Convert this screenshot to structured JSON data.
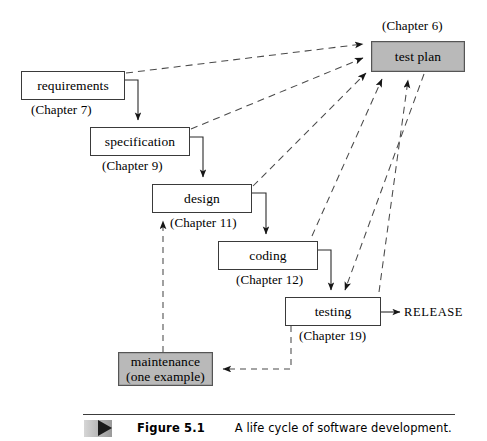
{
  "figure": {
    "number": "Figure 5.1",
    "caption": "A life cycle of software development.",
    "marker_icon": "triangle-right-icon"
  },
  "diagram": {
    "type": "flow-diagram",
    "title": "A life cycle of software development",
    "shaded_fill": "#b9b9b9",
    "nodes": [
      {
        "id": "requirements",
        "label": "requirements",
        "chapter": "(Chapter 7)",
        "shaded": false,
        "x": 21,
        "y": 71,
        "w": 104,
        "h": 29
      },
      {
        "id": "specification",
        "label": "specification",
        "chapter": "(Chapter 9)",
        "shaded": false,
        "x": 90,
        "y": 127,
        "w": 100,
        "h": 29
      },
      {
        "id": "design",
        "label": "design",
        "chapter": "(Chapter 11)",
        "shaded": false,
        "x": 152,
        "y": 184,
        "w": 100,
        "h": 29
      },
      {
        "id": "coding",
        "label": "coding",
        "chapter": "(Chapter 12)",
        "shaded": false,
        "x": 218,
        "y": 241,
        "w": 100,
        "h": 29
      },
      {
        "id": "testing",
        "label": "testing",
        "chapter": "(Chapter 19)",
        "shaded": false,
        "x": 285,
        "y": 297,
        "w": 96,
        "h": 29
      },
      {
        "id": "maintenance",
        "label": "maintenance",
        "label2": "(one example)",
        "chapter": "",
        "shaded": true,
        "x": 118,
        "y": 352,
        "w": 95,
        "h": 34
      },
      {
        "id": "test-plan",
        "label": "test plan",
        "chapter": "(Chapter 6)",
        "shaded": true,
        "x": 371,
        "y": 41,
        "w": 94,
        "h": 31
      }
    ],
    "release": {
      "label": "RELEASE",
      "from": "testing"
    },
    "solid_edges": [
      {
        "from": "requirements",
        "to": "specification"
      },
      {
        "from": "specification",
        "to": "design"
      },
      {
        "from": "design",
        "to": "coding"
      },
      {
        "from": "coding",
        "to": "testing"
      },
      {
        "from": "testing",
        "to": "RELEASE"
      }
    ],
    "dashed_edges": [
      {
        "from": "requirements",
        "to": "test plan"
      },
      {
        "from": "specification",
        "to": "test plan"
      },
      {
        "from": "design",
        "to": "test plan"
      },
      {
        "from": "coding",
        "to": "test plan"
      },
      {
        "from": "testing",
        "to": "test plan"
      },
      {
        "from": "test plan",
        "to": "testing"
      },
      {
        "from": "testing",
        "to": "maintenance"
      },
      {
        "from": "maintenance",
        "to": "design"
      }
    ]
  }
}
